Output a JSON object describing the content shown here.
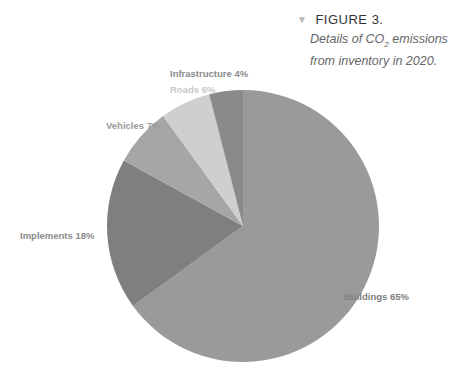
{
  "figure": {
    "label": "FIGURE 3.",
    "caption_line1_pre": "Details of CO",
    "caption_sub": "2",
    "caption_line1_post": " emissions",
    "caption_line2": "from inventory in 2020."
  },
  "chart_data": {
    "type": "pie",
    "title": "Details of CO2 emissions from inventory in 2020.",
    "categories": [
      "Buildings",
      "Implements",
      "Vehicles",
      "Roads",
      "Infrastructure"
    ],
    "values": [
      65,
      18,
      7,
      6,
      4
    ],
    "unit": "%",
    "colors": [
      "#9a9a9a",
      "#7f7f7f",
      "#a6a6a6",
      "#cfcfcf",
      "#8a8a8a"
    ],
    "start_angle_deg": 0,
    "direction": "clockwise",
    "legend": "none (labels beside slices)",
    "labels": [
      "Buildings 65%",
      "Implements 18%",
      "Vehicles 7%",
      "Roads 6%",
      "Infrastructure 4%"
    ]
  }
}
